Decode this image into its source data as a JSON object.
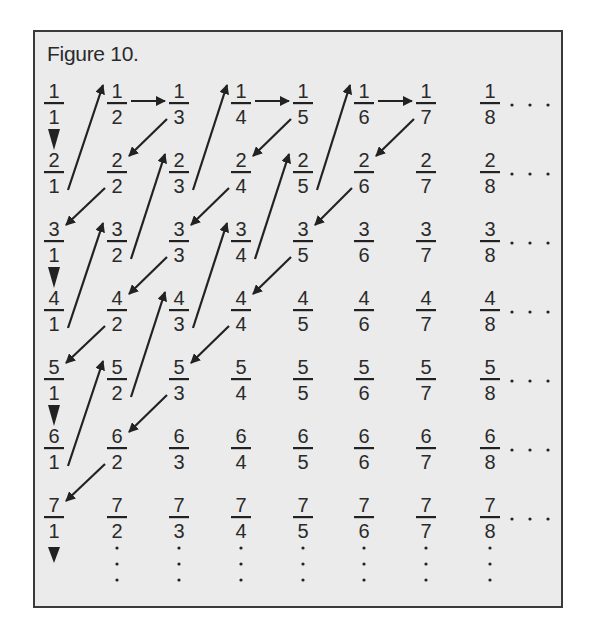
{
  "title": "Figure 10.",
  "colors": {
    "background": "#ebebeb",
    "border": "#3a3a3a",
    "ink": "#222222"
  },
  "grid": {
    "rows": 7,
    "cols": 8,
    "col_x": [
      54,
      117,
      179,
      241,
      303,
      364,
      426,
      490
    ],
    "row_bar_y": [
      103,
      172,
      241,
      310,
      379,
      448,
      517
    ],
    "row_ellipsis": "· · ·",
    "column_continuation": "⋮"
  },
  "fractions": [
    [
      "1/1",
      "1/2",
      "1/3",
      "1/4",
      "1/5",
      "1/6",
      "1/7",
      "1/8"
    ],
    [
      "2/1",
      "2/2",
      "2/3",
      "2/4",
      "2/5",
      "2/6",
      "2/7",
      "2/8"
    ],
    [
      "3/1",
      "3/2",
      "3/3",
      "3/4",
      "3/5",
      "3/6",
      "3/7",
      "3/8"
    ],
    [
      "4/1",
      "4/2",
      "4/3",
      "4/4",
      "4/5",
      "4/6",
      "4/7",
      "4/8"
    ],
    [
      "5/1",
      "5/2",
      "5/3",
      "5/4",
      "5/5",
      "5/6",
      "5/7",
      "5/8"
    ],
    [
      "6/1",
      "6/2",
      "6/3",
      "6/4",
      "6/5",
      "6/6",
      "6/7",
      "6/8"
    ],
    [
      "7/1",
      "7/2",
      "7/3",
      "7/4",
      "7/5",
      "7/6",
      "7/7",
      "7/8"
    ]
  ],
  "path": [
    [
      1,
      1
    ],
    [
      2,
      1
    ],
    [
      1,
      2
    ],
    [
      1,
      3
    ],
    [
      2,
      2
    ],
    [
      3,
      1
    ],
    [
      4,
      1
    ],
    [
      3,
      2
    ],
    [
      2,
      3
    ],
    [
      1,
      4
    ],
    [
      1,
      5
    ],
    [
      2,
      4
    ],
    [
      3,
      3
    ],
    [
      4,
      2
    ],
    [
      5,
      1
    ],
    [
      6,
      1
    ],
    [
      5,
      2
    ],
    [
      4,
      3
    ],
    [
      3,
      4
    ],
    [
      2,
      5
    ],
    [
      1,
      6
    ],
    [
      1,
      7
    ],
    [
      2,
      6
    ],
    [
      3,
      5
    ],
    [
      4,
      4
    ],
    [
      5,
      3
    ],
    [
      6,
      2
    ],
    [
      7,
      1
    ]
  ],
  "final_arrow": "down"
}
